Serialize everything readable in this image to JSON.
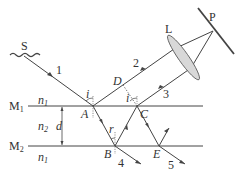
{
  "diagram": {
    "labels": {
      "source": "S",
      "lens": "L",
      "screen_point": "P",
      "mirror1": "M",
      "mirror1_sub": "1",
      "mirror2": "M",
      "mirror2_sub": "2",
      "n1_top": "n",
      "n1_top_sub": "1",
      "n2": "n",
      "n2_sub": "2",
      "n1_bottom": "n",
      "n1_bottom_sub": "1",
      "thickness": "d",
      "point_A": "A",
      "point_B": "B",
      "point_C": "C",
      "point_D": "D",
      "point_E": "E",
      "angle_i_A": "i",
      "angle_i_C": "i",
      "angle_r": "r",
      "ray1": "1",
      "ray2": "2",
      "ray3": "3",
      "ray4": "4",
      "ray5": "5"
    }
  }
}
